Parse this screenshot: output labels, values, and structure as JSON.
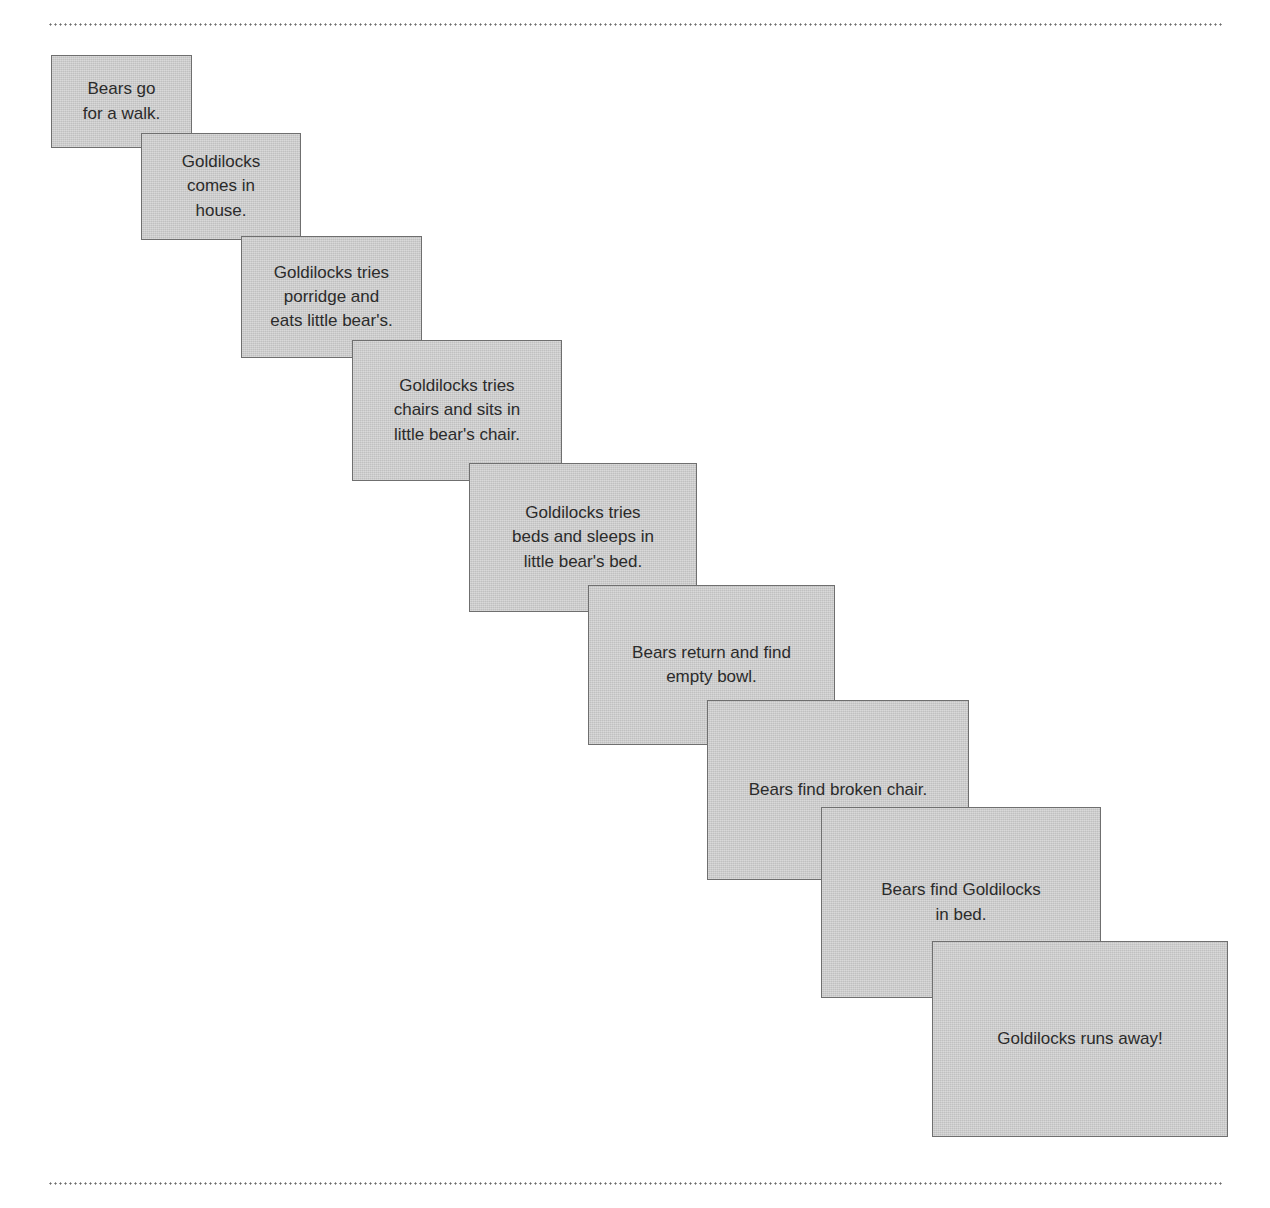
{
  "page": {
    "background_color": "#ffffff",
    "card_fill_color": "#cbcbcb",
    "card_border_color": "#6f6f6f",
    "text_color": "#2b2b2b",
    "rule_color": "#6d6d6d"
  },
  "top_rule": {
    "label": "top dotted divider"
  },
  "bottom_rule": {
    "label": "bottom dotted divider"
  },
  "sequence": {
    "label": "Goldilocks and the Three Bears story sequence",
    "cards": [
      {
        "index": 1,
        "text": "Bears go\nfor a walk.",
        "x": 51,
        "y": 55,
        "w": 141,
        "h": 93,
        "font_size": 17
      },
      {
        "index": 2,
        "text": "Goldilocks\ncomes in\nhouse.",
        "x": 141,
        "y": 133,
        "w": 160,
        "h": 107,
        "font_size": 17
      },
      {
        "index": 3,
        "text": "Goldilocks tries\nporridge and\neats little bear's.",
        "x": 241,
        "y": 236,
        "w": 181,
        "h": 122,
        "font_size": 17
      },
      {
        "index": 4,
        "text": "Goldilocks tries\nchairs and sits in\nlittle bear's chair.",
        "x": 352,
        "y": 340,
        "w": 210,
        "h": 141,
        "font_size": 17
      },
      {
        "index": 5,
        "text": "Goldilocks tries\nbeds and sleeps in\nlittle bear's bed.",
        "x": 469,
        "y": 463,
        "w": 228,
        "h": 149,
        "font_size": 17
      },
      {
        "index": 6,
        "text": "Bears return and find\nempty bowl.",
        "x": 588,
        "y": 585,
        "w": 247,
        "h": 160,
        "font_size": 17
      },
      {
        "index": 7,
        "text": "Bears find broken chair.",
        "x": 707,
        "y": 700,
        "w": 262,
        "h": 180,
        "font_size": 17
      },
      {
        "index": 8,
        "text": "Bears find Goldilocks\nin bed.",
        "x": 821,
        "y": 807,
        "w": 280,
        "h": 191,
        "font_size": 17
      },
      {
        "index": 9,
        "text": "Goldilocks runs away!",
        "x": 932,
        "y": 941,
        "w": 296,
        "h": 196,
        "font_size": 17
      }
    ]
  }
}
